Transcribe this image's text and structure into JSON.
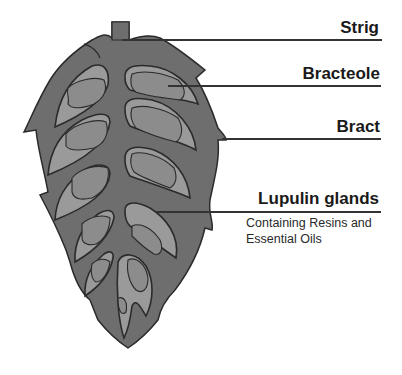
{
  "diagram": {
    "colors": {
      "bract": "#6e6e6e",
      "bracteole": "#9a9a9a",
      "gland": "#8c8c8c",
      "outline": "#2b2b2b"
    },
    "labels": [
      {
        "id": "strig",
        "text": "Strig"
      },
      {
        "id": "bracteole",
        "text": "Bracteole"
      },
      {
        "id": "bract",
        "text": "Bract"
      },
      {
        "id": "lupulin",
        "text": "Lupulin glands",
        "subtext_1": "Containing Resins and",
        "subtext_2": "Essential Oils"
      }
    ]
  }
}
